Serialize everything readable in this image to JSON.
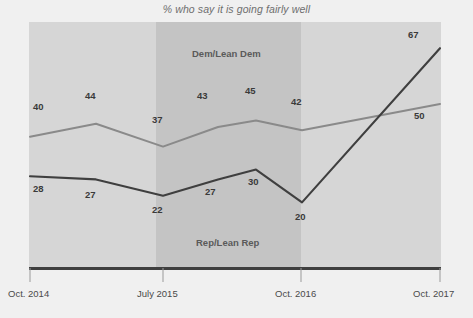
{
  "chart_data": {
    "type": "line",
    "title": "% who say it is going fairly well",
    "xlabel": "",
    "ylabel": "",
    "ylim": [
      0,
      75
    ],
    "grid": false,
    "legend_position": "inline-annotation",
    "x": [
      "Oct. 2014",
      "Jan. 2015",
      "July 2015",
      "Jan. 2016",
      "May 2016",
      "Oct. 2016",
      "Oct. 2017"
    ],
    "tick_labels": [
      "Oct. 2014",
      "July 2015",
      "Oct. 2016",
      "Oct. 2017"
    ],
    "series": [
      {
        "name": "Dem/Lean Dem",
        "color": "#8a8a8a",
        "values": [
          40,
          44,
          37,
          43,
          45,
          42,
          50
        ]
      },
      {
        "name": "Rep/Lean Rep",
        "color": "#3f3f3f",
        "values": [
          28,
          27,
          22,
          27,
          30,
          20,
          67
        ]
      }
    ],
    "annotations": {
      "dem_label": "Dem/Lean Dem",
      "rep_label": "Rep/Lean Rep"
    },
    "data_labels": {
      "dem": [
        "40",
        "44",
        "37",
        "43",
        "45",
        "42",
        "50"
      ],
      "rep": [
        "28",
        "27",
        "22",
        "27",
        "30",
        "20",
        "67"
      ]
    }
  },
  "axis": {
    "tick_0": "Oct. 2014",
    "tick_1": "July 2015",
    "tick_2": "Oct. 2016",
    "tick_3": "Oct. 2017"
  }
}
